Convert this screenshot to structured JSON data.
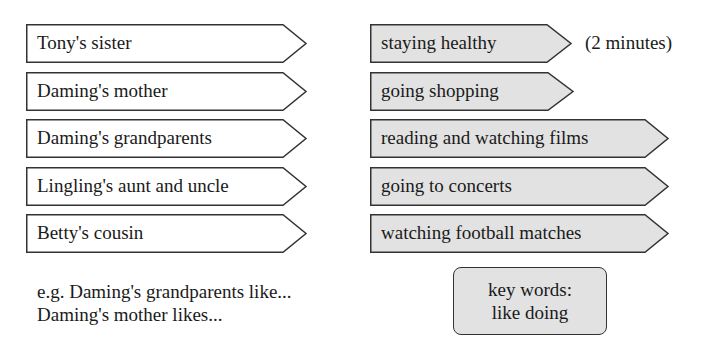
{
  "colors": {
    "border": "#333333",
    "people_fill": "#ffffff",
    "activity_fill": "#e2e2e2"
  },
  "people": [
    {
      "label": "Tony's sister"
    },
    {
      "label": "Daming's mother"
    },
    {
      "label": "Daming's grandparents"
    },
    {
      "label": "Lingling's aunt and uncle"
    },
    {
      "label": "Betty's cousin"
    }
  ],
  "activities": [
    {
      "label": "staying healthy"
    },
    {
      "label": "going shopping"
    },
    {
      "label": "reading and watching films"
    },
    {
      "label": "going to concerts"
    },
    {
      "label": "watching football matches"
    }
  ],
  "time_note": "(2 minutes)",
  "examples": [
    "e.g. Daming's grandparents like...",
    "Daming's mother likes..."
  ],
  "key_words": {
    "line1": "key words:",
    "line2": "like doing"
  }
}
